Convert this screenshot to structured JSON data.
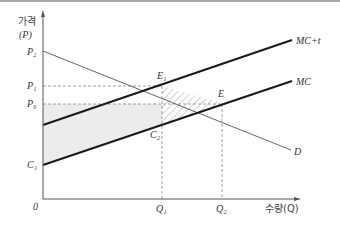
{
  "axes": {
    "y_label": "가격",
    "y_sublabel": "(P)",
    "x_label": "수량(Q)",
    "origin": "0"
  },
  "y_ticks": {
    "p2": "P₂",
    "p1": "P₁",
    "p0": "P₀",
    "c1": "C₁"
  },
  "x_ticks": {
    "q1": "Q₁",
    "q2": "Q₂"
  },
  "curves": {
    "mc_t": "MC+t",
    "mc": "MC",
    "d": "D"
  },
  "points": {
    "e1": "E₁",
    "e": "E",
    "c2": "C₂"
  },
  "colors": {
    "curve": "#1a1a1a",
    "demand": "#555555",
    "shaded": "#ececec",
    "hatch": "#888888",
    "guide": "#888888"
  }
}
